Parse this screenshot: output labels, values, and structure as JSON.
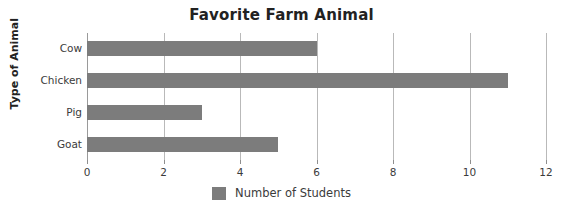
{
  "chart_data": {
    "type": "bar",
    "orientation": "horizontal",
    "title": "Favorite Farm Animal",
    "xlabel": "",
    "ylabel": "Type of Animal",
    "categories": [
      "Cow",
      "Chicken",
      "Pig",
      "Goat"
    ],
    "values": [
      6,
      11,
      3,
      5
    ],
    "series": [
      {
        "name": "Number of Students",
        "values": [
          6,
          11,
          3,
          5
        ]
      }
    ],
    "xlim": [
      0,
      12
    ],
    "xticks": [
      0,
      2,
      4,
      6,
      8,
      10,
      12
    ],
    "xtick_labels": [
      "0",
      "2",
      "4",
      "6",
      "8",
      "10",
      "12"
    ],
    "grid": "vertical",
    "legend": {
      "position": "bottom",
      "entries": [
        {
          "label": "Number of Students",
          "color": "#7c7c7c"
        }
      ]
    },
    "colors": {
      "bar": "#7c7c7c",
      "gridline": "#b9b9b9",
      "axis": "#9a9a9a",
      "title_text": "#222222",
      "tick_text": "#3b3b3b",
      "background": "#ffffff"
    }
  }
}
